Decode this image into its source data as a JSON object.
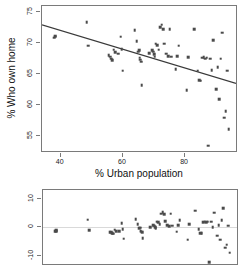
{
  "figure": {
    "background": "#ffffff",
    "point_color": "#4a4a4a",
    "line_color": "#3a3a3a",
    "frame_color": "#7a7a7a",
    "zero_line_color": "#d9d9d9"
  },
  "chart_data": [
    {
      "type": "scatter",
      "title": "",
      "xlabel": "% Urban population",
      "ylabel": "% Who own home",
      "xlim": [
        34,
        97
      ],
      "ylim": [
        52.2,
        76.0
      ],
      "xticks": [
        40,
        60,
        80
      ],
      "yticks": [
        55,
        60,
        65,
        70,
        75
      ],
      "grid": false,
      "legend": "none",
      "fit_line": {
        "type": "linear",
        "x_start": 34,
        "y_start": 72.9,
        "x_end": 97,
        "y_end": 63.3,
        "slope": -0.152,
        "intercept": 78.08
      },
      "x": [
        38.0,
        38.2,
        38.3,
        48.4,
        48.8,
        55.5,
        56.0,
        56.2,
        56.5,
        57.0,
        57.6,
        58.5,
        59.3,
        59.6,
        60.0,
        63.8,
        64.5,
        65.0,
        65.2,
        65.4,
        65.6,
        65.8,
        66.0,
        68.5,
        69.5,
        69.8,
        70.0,
        70.2,
        70.5,
        71.0,
        71.5,
        72.0,
        72.5,
        73.0,
        73.2,
        74.0,
        74.5,
        75.0,
        75.5,
        77.0,
        77.5,
        78.0,
        80.5,
        81.0,
        83.0,
        84.0,
        84.5,
        85.0,
        85.5,
        86.0,
        86.5,
        87.0,
        87.5,
        88.0,
        88.5,
        89.0,
        90.0,
        90.5,
        91.0,
        91.5,
        92.0,
        92.5,
        93.0,
        93.5,
        94.0
      ],
      "y": [
        70.9,
        71.0,
        71.2,
        73.4,
        69.6,
        68.0,
        67.8,
        67.5,
        67.2,
        68.9,
        68.5,
        68.3,
        71.0,
        69.0,
        65.5,
        72.1,
        70.3,
        68.6,
        68.8,
        67.6,
        67.3,
        67.0,
        63.2,
        68.4,
        68.8,
        68.6,
        68.2,
        67.8,
        69.9,
        69.7,
        68.9,
        72.6,
        73.0,
        72.2,
        69.9,
        68.3,
        67.9,
        72.2,
        67.8,
        65.8,
        67.9,
        69.6,
        62.4,
        67.7,
        72.2,
        65.5,
        64.0,
        63.9,
        67.6,
        67.7,
        67.5,
        67.6,
        53.4,
        67.5,
        65.6,
        70.5,
        62.5,
        66.1,
        60.9,
        67.5,
        71.7,
        57.9,
        59.0,
        65.5,
        56.1
      ]
    },
    {
      "type": "scatter",
      "title": "",
      "xlabel": "",
      "ylabel": "",
      "xlim": [
        34,
        97
      ],
      "ylim": [
        -13.5,
        13.0
      ],
      "xticks": [],
      "yticks": [
        -10,
        0,
        10
      ],
      "grid": false,
      "legend": "none",
      "zero_line": 0,
      "x": [
        38.0,
        38.2,
        38.3,
        48.4,
        48.8,
        55.5,
        56.0,
        56.2,
        56.5,
        57.0,
        57.6,
        58.5,
        59.3,
        59.6,
        60.0,
        63.8,
        64.5,
        65.0,
        65.2,
        65.4,
        65.6,
        65.8,
        66.0,
        68.5,
        69.5,
        69.8,
        70.0,
        70.2,
        70.5,
        71.0,
        71.5,
        72.0,
        72.5,
        73.0,
        73.2,
        74.0,
        74.5,
        75.0,
        75.5,
        77.0,
        77.5,
        78.0,
        80.5,
        81.0,
        83.0,
        84.0,
        84.5,
        85.0,
        85.5,
        86.0,
        86.5,
        87.0,
        87.5,
        88.0,
        88.5,
        89.0,
        90.0,
        90.5,
        91.0,
        91.5,
        92.0,
        92.5,
        93.0,
        93.5,
        94.0
      ],
      "y": [
        -1.4,
        -1.3,
        -1.1,
        2.6,
        -1.1,
        -1.7,
        -1.8,
        -2.1,
        -2.3,
        -0.8,
        -1.3,
        -1.4,
        1.4,
        -0.6,
        -4.0,
        2.8,
        1.1,
        -0.3,
        -0.1,
        -1.2,
        -1.5,
        -1.8,
        -3.9,
        0.1,
        0.7,
        0.5,
        0.1,
        -0.3,
        1.9,
        1.8,
        1.1,
        4.8,
        5.3,
        4.5,
        2.2,
        0.7,
        0.4,
        4.8,
        0.5,
        -1.5,
        0.7,
        2.5,
        -4.3,
        1.0,
        5.8,
        -0.6,
        -2.0,
        -2.1,
        1.7,
        1.9,
        1.7,
        1.9,
        -12.1,
        1.9,
        0.1,
        5.1,
        -2.9,
        0.8,
        -4.3,
        2.4,
        6.7,
        -7.1,
        -6.1,
        0.5,
        -8.8
      ]
    }
  ],
  "top_panel": {
    "x_axis_title": "% Urban population",
    "y_axis_title": "% Who own home",
    "x_tick_labels": [
      "40",
      "60",
      "80"
    ],
    "y_tick_labels": [
      "55",
      "60",
      "65",
      "70",
      "75"
    ]
  },
  "bottom_panel": {
    "y_tick_labels": [
      "-10",
      "0",
      "10"
    ]
  }
}
